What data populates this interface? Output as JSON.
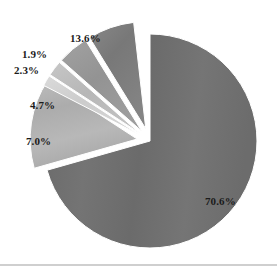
{
  "chart_data": {
    "type": "pie",
    "title": "",
    "subtitle": "",
    "xlabel": "",
    "ylabel": "",
    "legend_position": "none",
    "grid": false,
    "exploded": true,
    "units": "percent",
    "categories": [
      "70.6%",
      "13.6%",
      "7.0%",
      "4.7%",
      "2.3%",
      "1.9%"
    ],
    "values": [
      70.6,
      13.6,
      7.0,
      4.7,
      2.3,
      1.9
    ],
    "slices": [
      {
        "label": "70.6%",
        "value": 70.6,
        "color": "#6e6e6e",
        "start_angle_deg": 0,
        "end_angle_deg": 254.16,
        "exploded": false,
        "label_x": 205,
        "label_y": 196
      },
      {
        "label": "13.6%",
        "value": 13.6,
        "color": "#b3b3b3",
        "start_angle_deg": 254.16,
        "end_angle_deg": 303.12,
        "exploded": true,
        "label_x": 70,
        "label_y": 33
      },
      {
        "label": "7.0%",
        "value": 7.0,
        "color": "#7d7d7d",
        "start_angle_deg": 328.32,
        "end_angle_deg": 353.52,
        "exploded": true,
        "label_x": 26,
        "label_y": 136
      },
      {
        "label": "4.7%",
        "value": 4.7,
        "color": "#989898",
        "start_angle_deg": 311.4,
        "end_angle_deg": 328.32,
        "exploded": true,
        "label_x": 30,
        "label_y": 100
      },
      {
        "label": "2.3%",
        "value": 2.3,
        "color": "#bdbdbd",
        "start_angle_deg": 303.12,
        "end_angle_deg": 311.4,
        "exploded": true,
        "label_x": 14,
        "label_y": 65
      },
      {
        "label": "1.9%",
        "value": 1.9,
        "color": "#d2d2d2",
        "start_angle_deg": 297.3,
        "end_angle_deg": 303.12,
        "exploded": true,
        "label_x": 22,
        "label_y": 49
      }
    ],
    "total": 100.1,
    "background_color": "#ffffff",
    "label_text_color": "#1b1b1b"
  }
}
